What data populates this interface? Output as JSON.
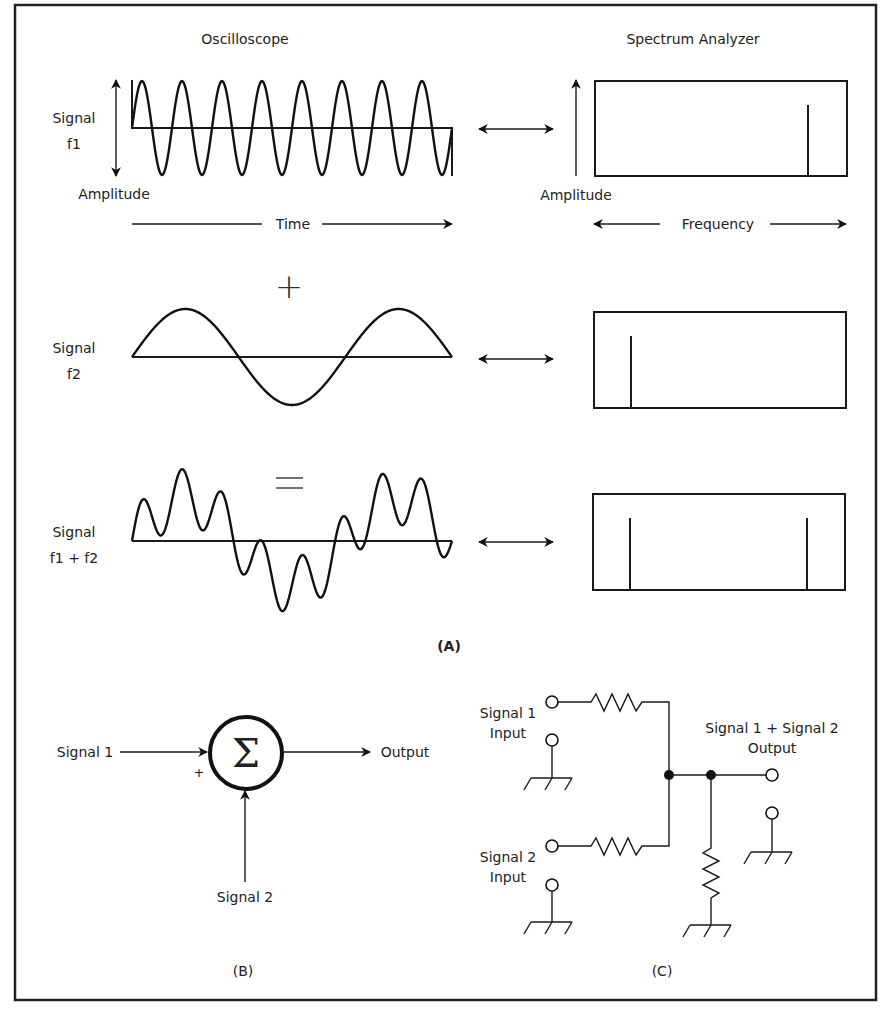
{
  "figure": {
    "panel_a": {
      "label": "(A)",
      "oscilloscope_title": "Oscilloscope",
      "spectrum_title": "Spectrum Analyzer",
      "rows": [
        {
          "signal_label_line1": "Signal",
          "signal_label_line2": "f1",
          "description": "high-frequency sine, 8 cycles",
          "spectrum_peaks_x": [
            808
          ]
        },
        {
          "operator": "+",
          "signal_label_line1": "Signal",
          "signal_label_line2": "f2",
          "description": "low-frequency sine, 1 cycle",
          "spectrum_peaks_x": [
            631
          ]
        },
        {
          "operator": "=",
          "signal_label_line1": "Signal",
          "signal_label_line2": "f1 + f2",
          "description": "sum of f1 and f2",
          "spectrum_peaks_x": [
            630,
            807
          ]
        }
      ],
      "osc_amplitude_label": "Amplitude",
      "osc_time_label": "Time",
      "spec_amplitude_label": "Amplitude",
      "spec_frequency_label": "Frequency"
    },
    "panel_b": {
      "label": "(B)",
      "input1": "Signal 1",
      "input2": "Signal 2",
      "output": "Output",
      "plus_sign": "+",
      "sum_symbol": "Σ"
    },
    "panel_c": {
      "label": "(C)",
      "input1_line1": "Signal 1",
      "input1_line2": "Input",
      "input2_line1": "Signal 2",
      "input2_line2": "Input",
      "output_line1": "Signal 1 + Signal 2",
      "output_line2": "Output"
    }
  }
}
